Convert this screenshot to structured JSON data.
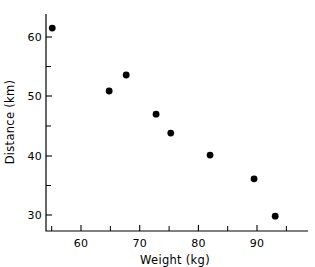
{
  "chart_data": {
    "type": "scatter",
    "title": "",
    "xlabel": "Weight (kg)",
    "ylabel": "Distance (km)",
    "xlim": [
      52.5,
      96.5
    ],
    "ylim": [
      27.5,
      64.0
    ],
    "grid": false,
    "legend": null,
    "marker": {
      "shape": "circle",
      "color": "#000000",
      "size": 4.6
    },
    "xticks": [
      60,
      70,
      80,
      90
    ],
    "xtick_labels": [
      "60",
      "70",
      "80",
      "90"
    ],
    "xminor_ticks": [
      55,
      65,
      75,
      85,
      95
    ],
    "yticks": [
      30,
      40,
      50,
      60
    ],
    "ytick_labels": [
      "30",
      "40",
      "50",
      "60"
    ],
    "yminor_ticks": [
      35,
      45,
      55
    ],
    "x": [
      55.1,
      64.8,
      67.7,
      72.8,
      75.3,
      82.0,
      89.5,
      93.1
    ],
    "y": [
      61.5,
      50.9,
      53.6,
      47.0,
      43.8,
      40.1,
      36.1,
      29.8
    ],
    "points": [
      {
        "x": 55.1,
        "y": 61.5
      },
      {
        "x": 64.8,
        "y": 50.9
      },
      {
        "x": 67.7,
        "y": 53.6
      },
      {
        "x": 72.8,
        "y": 47.0
      },
      {
        "x": 75.3,
        "y": 43.8
      },
      {
        "x": 82.0,
        "y": 40.1
      },
      {
        "x": 89.5,
        "y": 36.1
      },
      {
        "x": 93.1,
        "y": 29.8
      }
    ]
  },
  "axes": {
    "x_label": "Weight (kg)",
    "y_label": "Distance (km)"
  },
  "tick_text": {
    "x": [
      "60",
      "70",
      "80",
      "90"
    ],
    "y": [
      "30",
      "40",
      "50",
      "60"
    ]
  },
  "colors": {
    "marker": "#000000",
    "axis": "#000000",
    "background": "#ffffff"
  }
}
